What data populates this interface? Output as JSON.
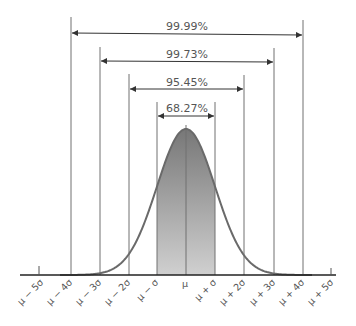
{
  "diagram": {
    "title": "",
    "colors": {
      "line": "#6f6f6f",
      "curve": "#6a6a6a",
      "fill_top": "#7a7a7a",
      "fill_bottom": "#d2d2d2",
      "text": "#555555",
      "axis": "#333333"
    },
    "axis": {
      "labels": [
        "μ − 5σ",
        "μ − 4σ",
        "μ − 3σ",
        "μ − 2σ",
        "μ − σ",
        "μ",
        "μ + σ",
        "μ + 2σ",
        "μ + 3σ",
        "μ + 4σ",
        "μ + 5σ"
      ]
    },
    "intervals": [
      {
        "label": "99.99%",
        "range": "μ ± 4σ"
      },
      {
        "label": "99.73%",
        "range": "μ ± 3σ"
      },
      {
        "label": "95.45%",
        "range": "μ ± 2σ"
      },
      {
        "label": "68.27%",
        "range": "μ ± σ"
      }
    ],
    "shaded_region": "μ − σ to μ + σ"
  }
}
